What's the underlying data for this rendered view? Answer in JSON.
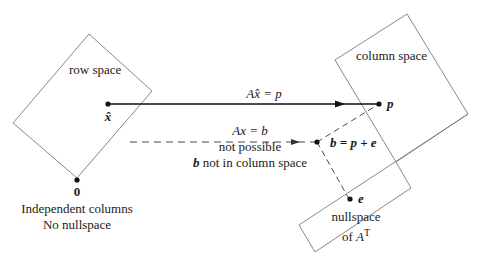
{
  "diagram": {
    "regions": {
      "row_space": {
        "label": "row space"
      },
      "column_space": {
        "label": "column space"
      },
      "left_nullspace": {
        "line1": "nullspace",
        "line2_prefix": "of ",
        "line2_matrix": "A",
        "line2_sup": "T"
      }
    },
    "points": {
      "x_hat": {
        "label": "x̂"
      },
      "zero": {
        "label": "0"
      },
      "p": {
        "label": "p"
      },
      "b": {
        "label": "b = p + e"
      },
      "e": {
        "label": "e"
      }
    },
    "arrows": {
      "solid": {
        "label": "Ax̂ = p"
      },
      "dashed": {
        "line1": "Ax = b",
        "line2": "not possible",
        "line3_b": "b",
        "line3_rest": " not in column space"
      }
    },
    "caption": {
      "line1": "Independent columns",
      "line2": "No nullspace"
    },
    "colors": {
      "outline": "#7a7a7a",
      "ink": "#111111"
    }
  }
}
